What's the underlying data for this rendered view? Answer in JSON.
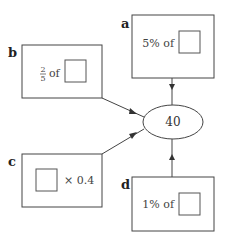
{
  "diagram": {
    "center_value": "40",
    "boxes": [
      {
        "id": "a",
        "label": "a",
        "text": "5% of",
        "blank": true
      },
      {
        "id": "b",
        "label": "b",
        "numerator": "2",
        "denominator": "5",
        "text": "of",
        "blank": true
      },
      {
        "id": "c",
        "label": "c",
        "text": "× 0.4",
        "blank": true
      },
      {
        "id": "d",
        "label": "d",
        "text": "1% of",
        "blank": true
      }
    ],
    "colors": {
      "stroke": "#444444",
      "background": "#ffffff"
    }
  }
}
